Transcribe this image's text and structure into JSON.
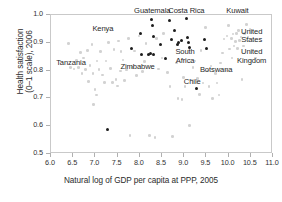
{
  "chart_data": {
    "type": "scatter",
    "title": "",
    "xlabel": "Natural log of GDP per capita at PPP, 2005",
    "ylabel_line1": "Health satisfaction",
    "ylabel_line2": "(0–1 scale), 2006",
    "xlim": [
      6.0,
      11.0
    ],
    "ylim": [
      0.5,
      1.0
    ],
    "xticks": [
      "6.0",
      "6.5",
      "7.0",
      "7.5",
      "8.0",
      "8.5",
      "9.0",
      "9.5",
      "10.0",
      "10.5",
      "11.0"
    ],
    "xtick_values": [
      6.0,
      6.5,
      7.0,
      7.5,
      8.0,
      8.5,
      9.0,
      9.5,
      10.0,
      10.5,
      11.0
    ],
    "yticks": [
      "0.5",
      "0.6",
      "0.7",
      "0.8",
      "0.9",
      "1.0"
    ],
    "ytick_values": [
      0.5,
      0.6,
      0.7,
      0.8,
      0.9,
      1.0
    ],
    "grid": false,
    "legend": "none",
    "colors": {
      "highlighted_series": "#1d1d1d",
      "background_series": "#d2d2d2",
      "frame": "#c9c9c9",
      "text": "#1f1f1f"
    },
    "series": [
      {
        "name": "Highlighted countries (Latin America & Africa)",
        "marker_color": "#1d1d1d",
        "points": [
          [
            7.27,
            0.589
          ],
          [
            7.82,
            0.879
          ],
          [
            8.02,
            0.932
          ],
          [
            8.04,
            0.858
          ],
          [
            8.19,
            0.857
          ],
          [
            8.24,
            0.86
          ],
          [
            8.27,
            0.983
          ],
          [
            8.28,
            0.961
          ],
          [
            8.3,
            0.922
          ],
          [
            8.31,
            0.857
          ],
          [
            8.47,
            0.893
          ],
          [
            8.58,
            0.843
          ],
          [
            8.67,
            0.979
          ],
          [
            8.72,
            0.913
          ],
          [
            8.79,
            0.944
          ],
          [
            8.85,
            0.893
          ],
          [
            8.88,
            0.9
          ],
          [
            8.93,
            0.908
          ],
          [
            9.05,
            0.986
          ],
          [
            9.07,
            0.919
          ],
          [
            9.09,
            0.901
          ],
          [
            9.11,
            0.884
          ],
          [
            9.27,
            0.735
          ],
          [
            9.46,
            0.911
          ],
          [
            9.5,
            0.881
          ]
        ]
      },
      {
        "name": "All other countries",
        "marker_color": "#d2d2d2",
        "points": [
          [
            6.4,
            0.897
          ],
          [
            6.44,
            0.812
          ],
          [
            6.52,
            0.806
          ],
          [
            6.58,
            0.836
          ],
          [
            6.62,
            0.812
          ],
          [
            6.66,
            0.866
          ],
          [
            6.7,
            0.79
          ],
          [
            6.73,
            0.845
          ],
          [
            6.78,
            0.803
          ],
          [
            6.82,
            0.872
          ],
          [
            6.85,
            0.76
          ],
          [
            6.88,
            0.819
          ],
          [
            6.92,
            0.893
          ],
          [
            6.95,
            0.789
          ],
          [
            6.96,
            0.678
          ],
          [
            6.99,
            0.731
          ],
          [
            7.02,
            0.712
          ],
          [
            7.04,
            0.835
          ],
          [
            7.08,
            0.803
          ],
          [
            7.12,
            0.868
          ],
          [
            7.16,
            0.784
          ],
          [
            7.2,
            0.757
          ],
          [
            7.24,
            0.834
          ],
          [
            7.3,
            0.902
          ],
          [
            7.34,
            0.808
          ],
          [
            7.38,
            0.757
          ],
          [
            7.42,
            0.876
          ],
          [
            7.46,
            0.767
          ],
          [
            7.5,
            0.744
          ],
          [
            7.52,
            0.906
          ],
          [
            7.56,
            0.799
          ],
          [
            7.58,
            0.869
          ],
          [
            7.62,
            0.838
          ],
          [
            7.66,
            0.764
          ],
          [
            7.7,
            0.802
          ],
          [
            7.74,
            0.915
          ],
          [
            7.78,
            0.566
          ],
          [
            7.84,
            0.812
          ],
          [
            7.88,
            0.87
          ],
          [
            7.92,
            0.783
          ],
          [
            7.98,
            0.925
          ],
          [
            8.06,
            0.797
          ],
          [
            8.1,
            0.832
          ],
          [
            8.14,
            0.898
          ],
          [
            8.22,
            0.566
          ],
          [
            8.34,
            0.56
          ],
          [
            8.38,
            0.916
          ],
          [
            8.42,
            0.806
          ],
          [
            8.5,
            0.845
          ],
          [
            8.54,
            0.934
          ],
          [
            8.62,
            0.793
          ],
          [
            8.68,
            0.742
          ],
          [
            8.74,
            0.562
          ],
          [
            8.82,
            0.827
          ],
          [
            8.86,
            0.699
          ],
          [
            8.95,
            0.697
          ],
          [
            8.98,
            0.775
          ],
          [
            9.02,
            0.742
          ],
          [
            9.12,
            0.602
          ],
          [
            9.16,
            0.766
          ],
          [
            9.2,
            0.811
          ],
          [
            9.24,
            0.835
          ],
          [
            9.3,
            0.771
          ],
          [
            9.34,
            0.714
          ],
          [
            9.38,
            0.873
          ],
          [
            9.42,
            0.755
          ],
          [
            9.48,
            0.955
          ],
          [
            9.52,
            0.799
          ],
          [
            9.56,
            0.742
          ],
          [
            9.6,
            0.816
          ],
          [
            9.64,
            0.7
          ],
          [
            9.7,
            0.789
          ],
          [
            9.74,
            0.755
          ],
          [
            9.78,
            0.712
          ],
          [
            9.82,
            0.828
          ],
          [
            9.86,
            0.864
          ],
          [
            9.9,
            0.913
          ],
          [
            9.94,
            0.8
          ],
          [
            9.96,
            0.925
          ],
          [
            10.0,
            0.962
          ],
          [
            10.02,
            0.878
          ],
          [
            10.06,
            0.915
          ],
          [
            10.08,
            0.846
          ],
          [
            10.1,
            0.932
          ],
          [
            10.12,
            0.888
          ],
          [
            10.15,
            0.905
          ],
          [
            10.18,
            0.934
          ],
          [
            10.2,
            0.88
          ],
          [
            10.22,
            0.944
          ],
          [
            10.25,
            0.908
          ],
          [
            10.28,
            0.921
          ],
          [
            10.3,
            0.769
          ],
          [
            10.33,
            0.889
          ],
          [
            10.36,
            0.934
          ],
          [
            10.4,
            0.965
          ],
          [
            10.44,
            0.919
          ],
          [
            10.48,
            0.948
          ],
          [
            10.6,
            0.846
          ]
        ]
      }
    ],
    "annotations": [
      {
        "name": "guatemala",
        "text": "Guatemala",
        "x": 8.28,
        "y": 1.01,
        "align": "center"
      },
      {
        "name": "costa-rica",
        "text": "Costa Rica",
        "x": 9.05,
        "y": 1.01,
        "align": "center"
      },
      {
        "name": "kuwait",
        "text": "Kuwait",
        "x": 10.2,
        "y": 1.01,
        "align": "center"
      },
      {
        "name": "kenya",
        "text": "Kenya",
        "x": 7.17,
        "y": 0.945,
        "align": "center"
      },
      {
        "name": "united-states",
        "text": "United\nStates",
        "x": 10.52,
        "y": 0.935,
        "align": "center"
      },
      {
        "name": "united-kingdom",
        "text": "United\nKingdom",
        "x": 10.52,
        "y": 0.862,
        "align": "center"
      },
      {
        "name": "tanzania",
        "text": "Tanzania",
        "x": 6.45,
        "y": 0.823,
        "align": "center"
      },
      {
        "name": "zimbabwe",
        "text": "Zimbabwe",
        "x": 7.95,
        "y": 0.808,
        "align": "center"
      },
      {
        "name": "south-africa",
        "text": "South\nAfrica",
        "x": 9.02,
        "y": 0.862,
        "align": "center"
      },
      {
        "name": "botswana",
        "text": "Botswana",
        "x": 9.72,
        "y": 0.8,
        "align": "center"
      },
      {
        "name": "chile",
        "text": "Chile",
        "x": 9.18,
        "y": 0.757,
        "align": "center"
      }
    ]
  }
}
